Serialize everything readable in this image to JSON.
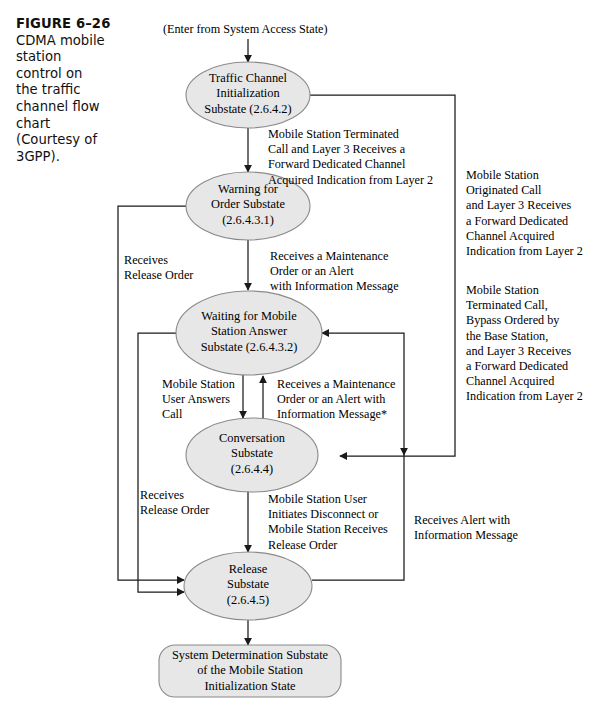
{
  "figure": {
    "number": "FIGURE 6–26",
    "caption": "CDMA mobile\nstation\ncontrol on\nthe traffic\nchannel flow\nchart\n(Courtesy of\n3GPP)."
  },
  "colors": {
    "node_fill": "#e7e7e7",
    "node_stroke": "#8a8a8a",
    "line": "#1a1a1a",
    "text": "#000000",
    "background": "#ffffff"
  },
  "entry": {
    "label": "(Enter from System Access State)"
  },
  "nodes": [
    {
      "id": "traffic-channel-initialization",
      "shape": "ellipse",
      "label": "Traffic Channel\nInitialization\nSubstate (2.6.4.2)"
    },
    {
      "id": "warning-for-order",
      "shape": "ellipse",
      "label": "Warning for\nOrder Substate\n(2.6.4.3.1)"
    },
    {
      "id": "waiting-for-mobile-station-answer",
      "shape": "ellipse",
      "label": "Waiting for Mobile\nStation Answer\nSubstate (2.6.4.3.2)"
    },
    {
      "id": "conversation",
      "shape": "ellipse",
      "label": "Conversation\nSubstate\n(2.6.4.4)"
    },
    {
      "id": "release",
      "shape": "ellipse",
      "label": "Release\nSubstate\n(2.6.4.5)"
    },
    {
      "id": "system-determination",
      "shape": "rounded-rect",
      "label": "System Determination Substate\nof the Mobile Station\nInitialization State"
    }
  ],
  "edge_labels": {
    "terminated_call_to_warning": "Mobile Station Terminated\nCall and Layer 3 Receives a\nForward Dedicated Channel\nAcquired Indication from Layer 2",
    "maintenance_to_waiting": "Receives a Maintenance\nOrder or an Alert\nwith Information Message",
    "receives_release_order_upper": "Receives\nRelease Order",
    "user_answers_call": "Mobile Station\nUser Answers\nCall",
    "maintenance_to_conversation": "Receives a Maintenance\nOrder or an Alert with\nInformation Message*",
    "receives_release_order_lower": "Receives\nRelease Order",
    "disconnect_to_release": "Mobile Station User\nInitiates Disconnect or\nMobile Station Receives\nRelease Order",
    "receives_alert_with_info": "Receives Alert with\nInformation Message",
    "originated_call": "Mobile Station\nOriginated Call\nand Layer 3 Receives\na Forward Dedicated\nChannel Acquired\nIndication from Layer 2",
    "terminated_call_bypass": "Mobile Station\nTerminated Call,\nBypass Ordered by\nthe Base Station,\nand Layer 3 Receives\na Forward Dedicated\nChannel Acquired\nIndication from Layer 2"
  }
}
